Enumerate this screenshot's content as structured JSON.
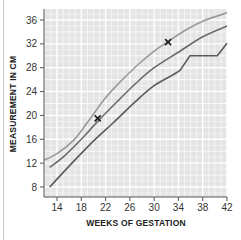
{
  "chart_data": {
    "type": "line",
    "title": "",
    "xlabel": "WEEKS OF GESTATION",
    "ylabel": "MEASUREMENT IN CM",
    "xlim": [
      12,
      42
    ],
    "ylim": [
      6,
      37.5
    ],
    "x_ticks": [
      14,
      18,
      22,
      26,
      30,
      34,
      38,
      42
    ],
    "y_ticks": [
      8,
      12,
      16,
      20,
      24,
      28,
      32,
      36
    ],
    "grid": true,
    "legend": null,
    "series": [
      {
        "name": "upper-centile",
        "color": "#9a9a9a",
        "points": [
          [
            11.9,
            12.5
          ],
          [
            14,
            13.6
          ],
          [
            16.8,
            15.9
          ],
          [
            19,
            18.8
          ],
          [
            21.7,
            22.6
          ],
          [
            24,
            25.2
          ],
          [
            27,
            28.2
          ],
          [
            30,
            30.8
          ],
          [
            32.3,
            32.4
          ],
          [
            35,
            34.2
          ],
          [
            38,
            35.8
          ],
          [
            42,
            37.2
          ]
        ]
      },
      {
        "name": "median",
        "color": "#6a6a6a",
        "points": [
          [
            12.8,
            11.3
          ],
          [
            15,
            13.0
          ],
          [
            18,
            16.0
          ],
          [
            20.7,
            19.0
          ],
          [
            24,
            22.4
          ],
          [
            27,
            25.4
          ],
          [
            30,
            28.0
          ],
          [
            34.3,
            30.8
          ],
          [
            38,
            33.2
          ],
          [
            42,
            35.0
          ]
        ]
      },
      {
        "name": "lower-centile",
        "color": "#5a5a5a",
        "points": [
          [
            12.8,
            8.0
          ],
          [
            16,
            11.5
          ],
          [
            19.5,
            15.2
          ],
          [
            23.4,
            18.9
          ],
          [
            27,
            22.4
          ],
          [
            30,
            25.0
          ],
          [
            34.3,
            27.6
          ],
          [
            35.9,
            30.0
          ],
          [
            40.4,
            30.0
          ],
          [
            42,
            32.1
          ]
        ]
      }
    ],
    "markers": [
      {
        "x": 20.7,
        "y": 19.5,
        "symbol": "x"
      },
      {
        "x": 32.3,
        "y": 32.3,
        "symbol": "x"
      }
    ]
  },
  "labels": {
    "x_axis_title": "WEEKS OF GESTATION",
    "y_axis_title": "MEASUREMENT IN CM"
  }
}
